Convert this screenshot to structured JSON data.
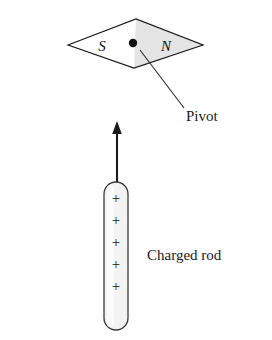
{
  "figure": {
    "background_color": "#ffffff",
    "stroke_color": "#1a1a1a",
    "shade_color": "#e3e3e3",
    "rod_fill_color": "#f2f2f2"
  },
  "compass": {
    "name": "compass-needle",
    "south_pole_label": "S",
    "north_pole_label": "N",
    "shaded_half": "north",
    "pivot_dot_label": "",
    "geometry": {
      "left_tip_x": 68,
      "right_tip_x": 203,
      "top_vertex_x": 136,
      "top_vertex_y": 19,
      "bottom_vertex_x": 134,
      "bottom_vertex_y": 68,
      "center_y": 45,
      "pivot_x": 133,
      "pivot_y": 43,
      "pivot_radius": 4
    }
  },
  "annotations": {
    "pivot_label": "Pivot",
    "charged_rod_label": "Charged rod",
    "leader_line": {
      "x1": 140,
      "y1": 50,
      "x2": 184,
      "y2": 108
    }
  },
  "rod": {
    "name": "charged-rod",
    "charge_symbol": "+",
    "charge_count": 5,
    "charges": [
      "+",
      "+",
      "+",
      "+",
      "+"
    ],
    "geometry": {
      "left": 104,
      "right": 128,
      "top": 182,
      "bottom": 330,
      "corner_radius": 12
    }
  },
  "arrow": {
    "name": "field-arrow",
    "direction": "up",
    "tip_x": 117,
    "tip_y": 121,
    "tail_x": 117,
    "tail_y": 183
  }
}
